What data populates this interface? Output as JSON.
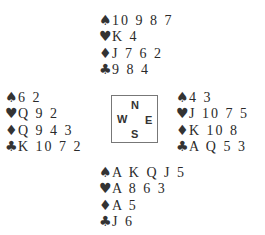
{
  "suits": {
    "spades": "♠",
    "hearts": "♥",
    "diamonds": "♦",
    "clubs": "♣"
  },
  "hands": {
    "north": {
      "spades": "10 9 8 7",
      "hearts": "K 4",
      "diamonds": "J 7 6 2",
      "clubs": "9 8 4"
    },
    "west": {
      "spades": "6 2",
      "hearts": "Q 9 2",
      "diamonds": "Q 9 4 3",
      "clubs": "K 10 7 2"
    },
    "east": {
      "spades": "4 3",
      "hearts": "J 10 7 5",
      "diamonds": "K 10 8",
      "clubs": "A Q 5 3"
    },
    "south": {
      "spades": "A K Q J 5",
      "hearts": "A 8 6 3",
      "diamonds": "A 5",
      "clubs": "J 6"
    }
  },
  "compass": {
    "n": "N",
    "w": "W",
    "e": "E",
    "s": "S"
  }
}
